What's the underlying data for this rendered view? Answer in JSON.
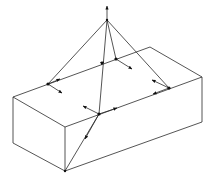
{
  "diagram": {
    "title": "",
    "colors": {
      "line": "#2a2a2a",
      "point": "#111111",
      "background": "#ffffff"
    },
    "apex": {
      "x": 107,
      "y": 20,
      "arrow_to": {
        "x": 107,
        "y": 6
      }
    },
    "box": {
      "top_face": [
        [
          13,
          97
        ],
        [
          150,
          47
        ],
        [
          202,
          77
        ],
        [
          65,
          127
        ]
      ],
      "bottom_left": [
        13,
        143
      ],
      "bottom_front": [
        65,
        171
      ],
      "bottom_right": [
        202,
        122
      ]
    },
    "points": [
      {
        "id": "P1",
        "x": 48,
        "y": 84
      },
      {
        "id": "P2",
        "x": 102,
        "y": 63
      },
      {
        "id": "P3",
        "x": 116,
        "y": 59
      },
      {
        "id": "P4",
        "x": 169,
        "y": 88
      },
      {
        "id": "P5",
        "x": 99,
        "y": 114
      }
    ]
  }
}
